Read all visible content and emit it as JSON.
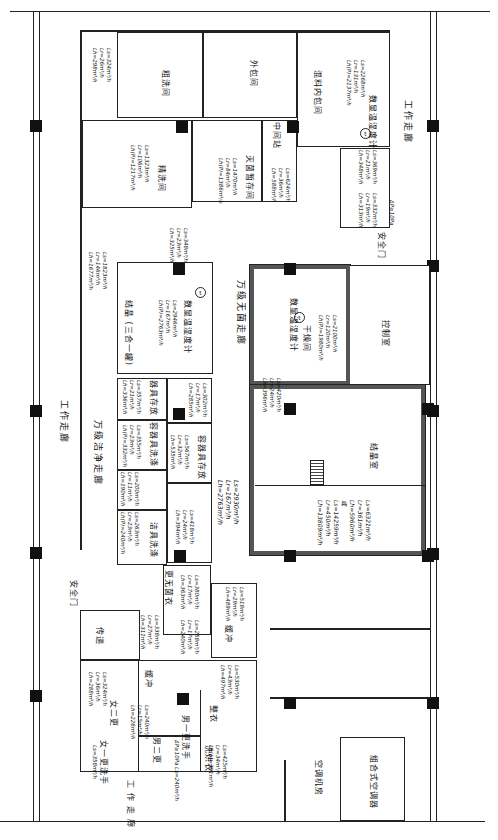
{
  "drawing": {
    "type": "clean-room floor plan (rotated 90°)",
    "corridors": {
      "work_corridor_left": "工作走廊",
      "work_corridor_right": "工作走廊",
      "work_corridor_bottom": "工作走廊",
      "clean_corridor_10k": "万级洁净走廊",
      "sterile_corridor_10k": "万级无菌走廊"
    },
    "doors": {
      "safety_door_left": "安全门",
      "safety_door_right": "安全门",
      "pass_box": "传递"
    },
    "rooms": [
      {
        "id": "rough-wash",
        "name": "粗洗间",
        "air": [
          "Ls=324m³/h",
          "Lr=26m³/h",
          "Lh=298m³/h"
        ]
      },
      {
        "id": "outer-pack",
        "name": "外包间",
        "air": []
      },
      {
        "id": "mix-inner-pack",
        "name": "混料内包间",
        "air": [
          "Ls=2268m³/h",
          "Lr=131m³/h",
          "Lh(P)=2137m³/h"
        ],
        "sensor": "数显温湿度计"
      },
      {
        "id": "fine-wash",
        "name": "精洗间",
        "air": [
          "Ls=1323m³/h",
          "Lr=106m³/h",
          "Lh(P)=1217m³/h"
        ]
      },
      {
        "id": "sterile-storage",
        "name": "灭菌暂存间",
        "air": [
          "Ls=1470m³/h",
          "Lr=84m³/h",
          "Lh(P)=1386m³/h"
        ]
      },
      {
        "id": "intermediate-station",
        "name": "中间站",
        "air": [
          "Ls=624m³/h",
          "Lr=36m³/h",
          "Lh=588m³/h"
        ]
      },
      {
        "id": "right-small-1",
        "name": "",
        "air": [
          "Ls=369m³/h",
          "Lr=21m³/h",
          "Lh=348m³/h"
        ]
      },
      {
        "id": "right-small-2",
        "name": "",
        "air": [
          "Ls=332m³/h",
          "Lr=19m³/h",
          "Lh=313m³/h"
        ],
        "pressure": "ΔP≥10Pa"
      },
      {
        "id": "crystallize-3in1",
        "name": "结晶 (三合一罐)",
        "air": [
          "Ls=2946m³/h",
          "Lr=167m³/h",
          "Lh(P)=2763m³/h"
        ],
        "sensor": "数显温湿度计"
      },
      {
        "id": "left-corridor-air",
        "name": "",
        "air": [
          "Ls=1823m³/h",
          "Lr=146m³/h",
          "Lh=1677m³/h"
        ]
      },
      {
        "id": "top-vestibule",
        "name": "",
        "air": [
          "Ls=348m³/h",
          "Lr=23m³/h",
          "Lh=325m³/h"
        ]
      },
      {
        "id": "dryer",
        "name": "干燥间",
        "air": [
          "Ls=2100m³/h",
          "Lr=120m³/h",
          "Lh(P)=1980m³/h"
        ],
        "sensor": "数显温湿度计"
      },
      {
        "id": "tool-storage",
        "name": "器具存放",
        "air": [
          "Ls=357m³/h",
          "Lr=21m³/h",
          "Lh=336m³/h"
        ]
      },
      {
        "id": "tool-storage-2",
        "name": "",
        "air": [
          "Ls=302m³/h",
          "Lr=17m³/h",
          "Lh=285m³/h"
        ]
      },
      {
        "id": "container-wash",
        "name": "容器具洗涤",
        "air": [
          "Ls=355m³/h",
          "Lr=23m³/h",
          "Lh(P)=332m³/h"
        ]
      },
      {
        "id": "container-storage",
        "name": "容器具存放",
        "air": [
          "Ls=567m³/h",
          "Lr=32m³/h",
          "Lh=535m³/h"
        ]
      },
      {
        "id": "clean-tool-wash-a",
        "name": "",
        "air": [
          "Ls=200m³/h",
          "Lr=11m³/h",
          "Lh=190m³/h"
        ]
      },
      {
        "id": "clean-tool-wash",
        "name": "洁具洗涤",
        "air": [
          "Ls=263m³/h",
          "Lr=23m³/h",
          "Lh(P)=240m³/h"
        ]
      },
      {
        "id": "small-room",
        "name": "",
        "air": [
          "Ls=418m³/h",
          "Lr=24m³/h",
          "Lh=394m³/h"
        ]
      },
      {
        "id": "sterile-corridor-air",
        "name": "",
        "air": [
          "Ls=2930m³/h",
          "Lr=167m³/h",
          "Lh=2763m³/h"
        ]
      },
      {
        "id": "airlock-center",
        "name": "",
        "air": [
          "Ls=420m³/h",
          "Lr=24m³/h",
          "Lh=396m³/h"
        ]
      },
      {
        "id": "crystallize-room",
        "name": "结晶室",
        "air": [
          "Ls=6321m³/h",
          "Lr=361m³/h",
          "Lh=5960m³/h",
          "或",
          "Ls=14259m³/h",
          "Lr=450m³/h",
          "Lh=13809m³/h"
        ]
      },
      {
        "id": "control-room",
        "name": "控制室",
        "air": []
      },
      {
        "id": "sterile-change",
        "name": "更无菌衣",
        "air": [
          "Ls=380m³/h",
          "Lr=17m³/h",
          "Lh=363m³/h"
        ]
      },
      {
        "id": "buffer-1",
        "name": "缓冲",
        "air": [
          "Ls=338m³/h",
          "Lr=27m³/h",
          "Lh=311m³/h"
        ]
      },
      {
        "id": "buffer-2",
        "name": "",
        "air": [
          "Ls=258m³/h",
          "Lr=17m³/h",
          "Lh=240m³/h"
        ]
      },
      {
        "id": "buffer-3",
        "name": "缓冲",
        "air": [
          "Ls=518m³/h",
          "Lr=29m³/h",
          "Lh=489m³/h"
        ]
      },
      {
        "id": "women-change2",
        "name": "女二更",
        "air": [
          "Ls=324m³/h",
          "Lr=36m³/h",
          "Lh=288m³/h"
        ]
      },
      {
        "id": "women-change1",
        "name": "女一更洗手",
        "air": [
          "Ls=358m³/h"
        ]
      },
      {
        "id": "men-change2",
        "name": "男二更",
        "air": [
          "Ls=240m³/h",
          "Lr=15m³/h",
          "Lh=226m³/h"
        ]
      },
      {
        "id": "men-change1",
        "name": "男一更洗手",
        "air": [
          "ΔP≥10Pa Ls=240m³/h"
        ]
      },
      {
        "id": "wash-clothes",
        "name": "洗烘衣",
        "air": [
          "Ls=425m³/h",
          "Lr=34m³/h",
          "Lh(p)=391m³/h"
        ]
      },
      {
        "id": "tidy-clothes",
        "name": "整衣",
        "air": [
          "Ls=530m³/h",
          "Lr=43m³/h",
          "Lh=497m³/h"
        ]
      },
      {
        "id": "ac-room",
        "name": "空调机房",
        "air": []
      },
      {
        "id": "ahu",
        "name": "组合式空调器",
        "air": []
      }
    ],
    "buffer_labels": [
      "缓冲",
      "缓冲"
    ],
    "pressure_note": "ΔP≥10Pa",
    "sensor_symbol": "t"
  }
}
